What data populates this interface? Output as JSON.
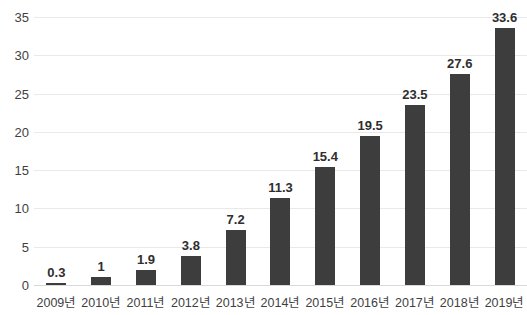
{
  "chart_data": {
    "type": "bar",
    "title": "",
    "subtitle": "",
    "xlabel": "",
    "ylabel": "",
    "categories": [
      "2009년",
      "2010년",
      "2011년",
      "2012년",
      "2013년",
      "2014년",
      "2015년",
      "2016년",
      "2017년",
      "2018년",
      "2019년"
    ],
    "values": [
      0.3,
      1,
      1.9,
      3.8,
      7.2,
      11.3,
      15.4,
      19.5,
      23.5,
      27.6,
      33.6
    ],
    "value_labels": [
      "0.3",
      "1",
      "1.9",
      "3.8",
      "7.2",
      "11.3",
      "15.4",
      "19.5",
      "23.5",
      "27.6",
      "33.6"
    ],
    "ylim": [
      0,
      35
    ],
    "y_ticks": [
      0,
      5,
      10,
      15,
      20,
      25,
      30,
      35
    ],
    "y_tick_labels": [
      "0",
      "5",
      "10",
      "15",
      "20",
      "25",
      "30",
      "35"
    ],
    "grid": true,
    "legend": false,
    "legend_position": "none",
    "bar_color": "#3d3d3d",
    "gridline_color": "#e9e9e9",
    "background_color": "#ffffff",
    "data_label_color": "#2e2e2e",
    "axis_label_color": "#3f3f3f"
  }
}
